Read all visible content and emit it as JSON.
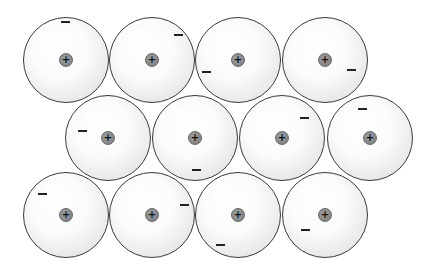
{
  "diagram": {
    "type": "metallic-bonding-lattice",
    "nucleus_symbol": "+",
    "electron_symbol": "−",
    "colors": {
      "atom_border": "#3a3a3a",
      "nucleus": "#8a8a8a",
      "electron": "#222222",
      "background": "#ffffff"
    },
    "atoms": [
      {
        "row": 1,
        "cx": 66,
        "cy": 60,
        "electron": [
          65,
          22
        ]
      },
      {
        "row": 1,
        "cx": 152,
        "cy": 60,
        "electron": [
          178,
          35
        ]
      },
      {
        "row": 1,
        "cx": 238,
        "cy": 60,
        "electron": [
          206,
          72
        ]
      },
      {
        "row": 1,
        "cx": 325,
        "cy": 60,
        "electron": [
          351,
          70
        ]
      },
      {
        "row": 2,
        "cx": 108,
        "cy": 138,
        "electron": [
          82,
          131
        ]
      },
      {
        "row": 2,
        "cx": 195,
        "cy": 138,
        "electron": [
          196,
          170
        ]
      },
      {
        "row": 2,
        "cx": 282,
        "cy": 138,
        "electron": [
          304,
          118
        ]
      },
      {
        "row": 2,
        "cx": 370,
        "cy": 138,
        "electron": [
          362,
          109
        ]
      },
      {
        "row": 3,
        "cx": 66,
        "cy": 215,
        "electron": [
          42,
          194
        ]
      },
      {
        "row": 3,
        "cx": 152,
        "cy": 215,
        "electron": [
          184,
          205
        ]
      },
      {
        "row": 3,
        "cx": 238,
        "cy": 215,
        "electron": [
          220,
          245
        ]
      },
      {
        "row": 3,
        "cx": 325,
        "cy": 215,
        "electron": [
          305,
          230
        ]
      }
    ]
  }
}
